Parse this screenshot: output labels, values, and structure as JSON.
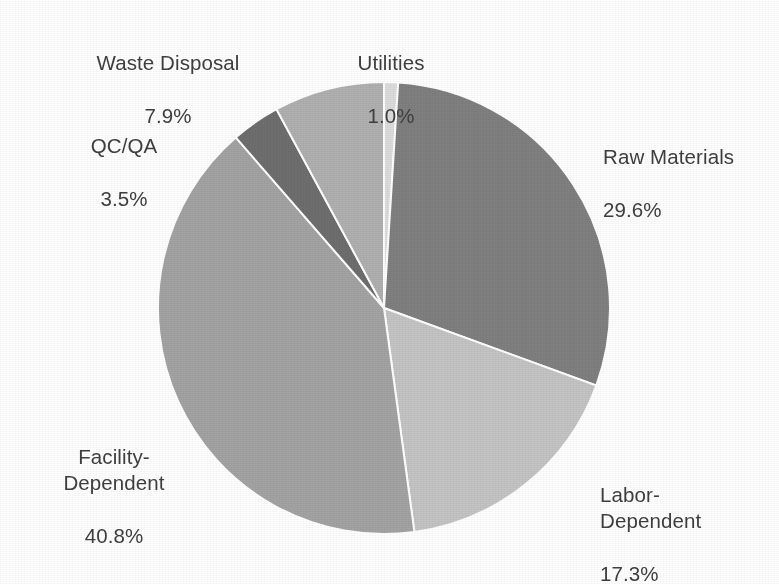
{
  "chart_data": {
    "type": "pie",
    "title": "",
    "subtitle": "",
    "xlabel": "",
    "ylabel": "",
    "legend_position": "none",
    "labels_position": "outside",
    "unit": "%",
    "total": 100.1,
    "start_angle_deg": 0,
    "direction": "clockwise",
    "categories": [
      "Utilities",
      "Raw Materials",
      "Labor-Dependent",
      "Facility-Dependent",
      "QC/QA",
      "Waste Disposal"
    ],
    "values": [
      1.0,
      29.6,
      17.3,
      40.8,
      3.5,
      7.9
    ],
    "colors": [
      "#dcdcdc",
      "#808080",
      "#c4c4c4",
      "#a3a3a3",
      "#6e6e6e",
      "#b0b0b0"
    ],
    "slices": [
      {
        "name": "Utilities",
        "value": 1.0,
        "value_label": "1.0%",
        "color": "#dcdcdc",
        "label_lines": [
          "Utilities",
          "1.0%"
        ]
      },
      {
        "name": "Raw Materials",
        "value": 29.6,
        "value_label": "29.6%",
        "color": "#808080",
        "label_lines": [
          "Raw Materials",
          "29.6%"
        ]
      },
      {
        "name": "Labor-Dependent",
        "value": 17.3,
        "value_label": "17.3%",
        "color": "#c4c4c4",
        "label_lines": [
          "Labor-",
          "Dependent",
          "17.3%"
        ]
      },
      {
        "name": "Facility-Dependent",
        "value": 40.8,
        "value_label": "40.8%",
        "color": "#a3a3a3",
        "label_lines": [
          "Facility-",
          "Dependent",
          "40.8%"
        ]
      },
      {
        "name": "QC/QA",
        "value": 3.5,
        "value_label": "3.5%",
        "color": "#6e6e6e",
        "label_lines": [
          "QC/QA",
          "3.5%"
        ]
      },
      {
        "name": "Waste Disposal",
        "value": 7.9,
        "value_label": "7.9%",
        "color": "#b0b0b0",
        "label_lines": [
          "Waste Disposal",
          "7.9%"
        ]
      }
    ]
  },
  "labels": {
    "waste_disposal": {
      "name": "Waste Disposal",
      "value": "7.9%"
    },
    "utilities": {
      "name": "Utilities",
      "value": "1.0%"
    },
    "raw_materials": {
      "name": "Raw Materials",
      "value": "29.6%"
    },
    "qc_qa": {
      "name": "QC/QA",
      "value": "3.5%"
    },
    "facility": {
      "name": "Facility-\nDependent",
      "value": "40.8%"
    },
    "labor": {
      "name": "Labor-\nDependent",
      "value": "17.3%"
    }
  },
  "style": {
    "background": "#ffffff",
    "text_color": "#3f3f3f",
    "slice_separator": "#ffffff"
  }
}
